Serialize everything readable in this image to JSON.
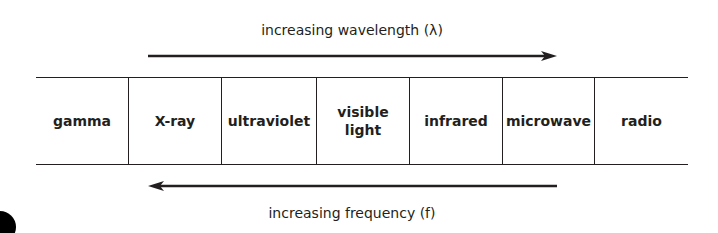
{
  "diagram": {
    "title_top": "increasing wavelength (λ)",
    "title_bottom": "increasing frequency (f)",
    "top_arrow_direction": "right",
    "bottom_arrow_direction": "left",
    "bands": [
      {
        "label": "gamma"
      },
      {
        "label": "X-ray"
      },
      {
        "label": "ultraviolet"
      },
      {
        "label": "visible light",
        "line1": "visible",
        "line2": "light"
      },
      {
        "label": "infrared"
      },
      {
        "label": "microwave"
      },
      {
        "label": "radio"
      }
    ],
    "colors": {
      "line": "#231f20",
      "text": "#231f20",
      "background": "#ffffff"
    }
  }
}
